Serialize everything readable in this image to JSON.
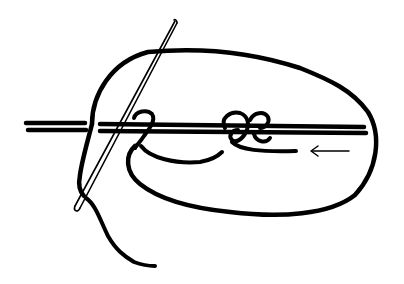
{
  "diagram": {
    "type": "line-illustration",
    "colors": {
      "background": "#ffffff",
      "ink": "#000000"
    },
    "elements": [
      {
        "id": "needle",
        "label": "needle"
      },
      {
        "id": "double-rod",
        "label": "double horizontal rod"
      },
      {
        "id": "thread-loop",
        "label": "thread loop"
      },
      {
        "id": "left-knot",
        "label": "left half-hitch"
      },
      {
        "id": "right-knot",
        "label": "double knot"
      },
      {
        "id": "tail",
        "label": "thread tail"
      },
      {
        "id": "direction-arrow",
        "label": "direction arrow (pointing left)"
      }
    ]
  }
}
